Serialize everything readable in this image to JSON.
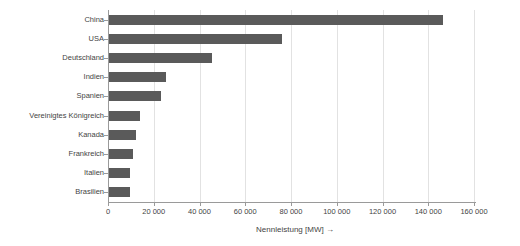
{
  "chart_data": {
    "type": "bar",
    "orientation": "horizontal",
    "title": "",
    "xlabel": "Nennleistung [MW] →",
    "ylabel": "",
    "xlim": [
      0,
      160000
    ],
    "ylim": null,
    "grid": true,
    "legend": null,
    "bar_color": "#5a5a5a",
    "categories": [
      "China",
      "USA",
      "Deutschland",
      "Indien",
      "Spanien",
      "Vereinigtes Königreich",
      "Kanada",
      "Frankreich",
      "Italien",
      "Brasilien"
    ],
    "values": [
      146400,
      76000,
      45500,
      25400,
      23000,
      14000,
      12200,
      11000,
      9600,
      9600
    ],
    "xticks": [
      0,
      20000,
      40000,
      60000,
      80000,
      100000,
      120000,
      140000,
      160000
    ],
    "xtick_labels": [
      "0",
      "20 000",
      "40 000",
      "60 000",
      "80 000",
      "100 000",
      "120 000",
      "140 000",
      "160 000"
    ]
  }
}
